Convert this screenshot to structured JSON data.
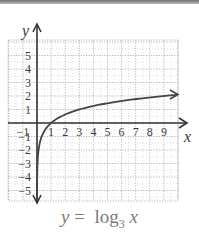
{
  "chart_data": {
    "type": "line",
    "title": "",
    "xlabel": "x",
    "ylabel": "y",
    "xlim": [
      -1,
      10
    ],
    "ylim": [
      -6,
      6
    ],
    "grid": true,
    "x_ticks": [
      "-1",
      "1",
      "2",
      "3",
      "4",
      "5",
      "6",
      "7",
      "8",
      "9"
    ],
    "y_ticks": [
      "5",
      "4",
      "3",
      "2",
      "1",
      "-1",
      "-2",
      "-3",
      "-4",
      "-5"
    ],
    "series": [
      {
        "name": "y = log3 x",
        "x": [
          0.01,
          0.05,
          0.1,
          0.2,
          0.333,
          0.5,
          1,
          2,
          3,
          4,
          5,
          6,
          7,
          8,
          9,
          10
        ],
        "values": [
          -4.19,
          -2.73,
          -2.1,
          -1.46,
          -1.0,
          -0.63,
          0,
          0.63,
          1.0,
          1.26,
          1.46,
          1.63,
          1.77,
          1.89,
          2.0,
          2.1
        ]
      }
    ],
    "annotations": [
      "y = log3 x"
    ]
  },
  "caption": {
    "lhs": "y",
    "eq": " = ",
    "fn": "log",
    "base": "3",
    "arg": " x"
  },
  "axis": {
    "x_label": "x",
    "y_label": "y"
  }
}
